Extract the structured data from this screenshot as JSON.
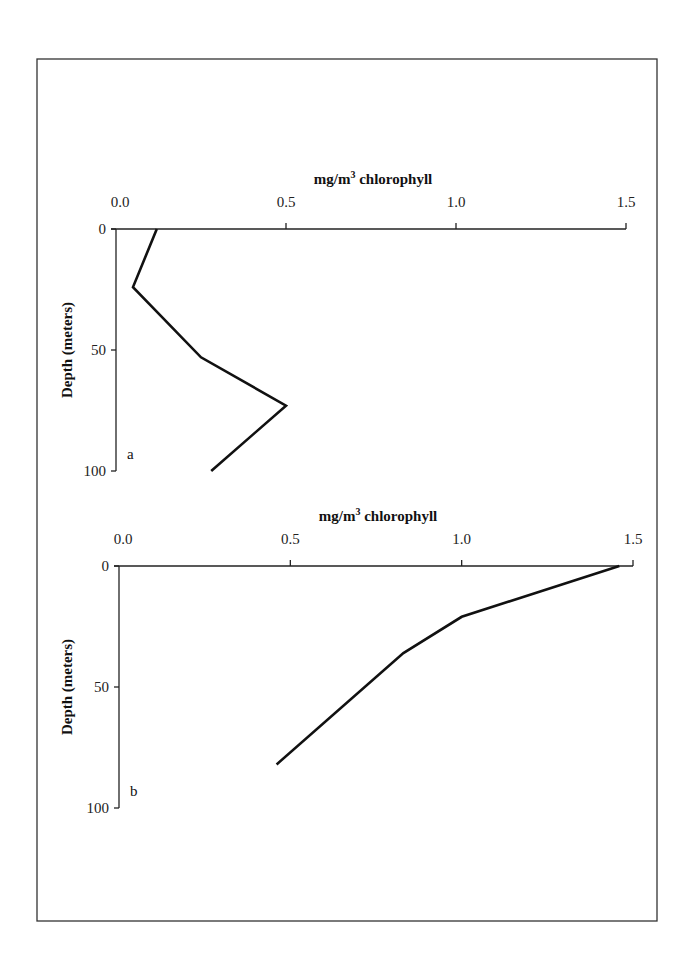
{
  "figure": {
    "frame": {
      "x": 37,
      "y": 59,
      "width": 620,
      "height": 862
    }
  },
  "chart_data": [
    {
      "type": "line",
      "panel_label": "a",
      "title": "mg/m3 chlorophyll",
      "title_main": "mg/m",
      "title_sup": "3",
      "title_rest": " chlorophyll",
      "xlabel": "mg/m3 chlorophyll",
      "ylabel": "Depth (meters)",
      "x_axis_position": "top",
      "y_inverted": true,
      "xlim": [
        0.0,
        1.5
      ],
      "ylim": [
        0,
        100
      ],
      "x_ticks": [
        0.0,
        0.5,
        1.0,
        1.5
      ],
      "x_tick_labels": [
        "0.0",
        "0.5",
        "1.0",
        "1.5"
      ],
      "y_ticks": [
        0,
        50,
        100
      ],
      "y_tick_labels": [
        "0",
        "50",
        "100"
      ],
      "grid": false,
      "series": [
        {
          "name": "chlorophyll",
          "x": [
            0.12,
            0.05,
            0.25,
            0.5,
            0.28
          ],
          "depth": [
            0,
            24,
            53,
            73,
            100
          ]
        }
      ],
      "layout": {
        "x0": 116,
        "x1": 626,
        "y0": 229,
        "y1": 471
      }
    },
    {
      "type": "line",
      "panel_label": "b",
      "title": "mg/m3 chlorophyll",
      "title_main": "mg/m",
      "title_sup": "3",
      "title_rest": " chlorophyll",
      "xlabel": "mg/m3 chlorophyll",
      "ylabel": "Depth (meters)",
      "x_axis_position": "top",
      "y_inverted": true,
      "xlim": [
        0.0,
        1.5
      ],
      "ylim": [
        0,
        100
      ],
      "x_ticks": [
        0.0,
        0.5,
        1.0,
        1.5
      ],
      "x_tick_labels": [
        "0.0",
        "0.5",
        "1.0",
        "1.5"
      ],
      "y_ticks": [
        0,
        50,
        100
      ],
      "y_tick_labels": [
        "0",
        "50",
        "100"
      ],
      "grid": false,
      "series": [
        {
          "name": "chlorophyll",
          "x": [
            1.46,
            1.0,
            0.83,
            0.46
          ],
          "depth": [
            0,
            21,
            36,
            82
          ]
        }
      ],
      "layout": {
        "x0": 119,
        "x1": 633,
        "y0": 566,
        "y1": 808
      }
    }
  ]
}
